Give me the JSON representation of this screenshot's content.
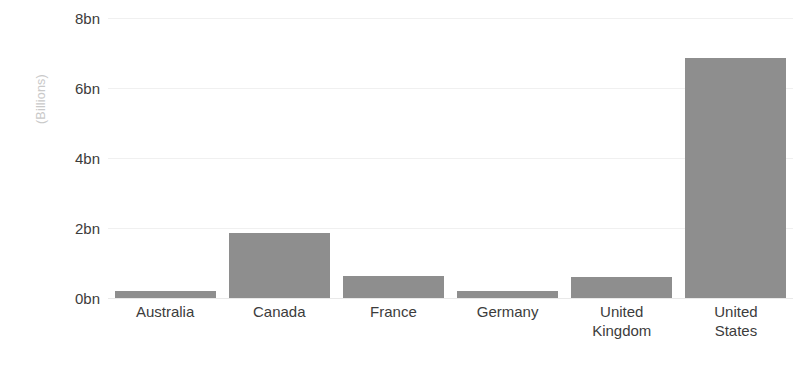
{
  "chart_data": {
    "type": "bar",
    "title": "",
    "subtitle": "",
    "xlabel": "",
    "ylabel": "(Billions)",
    "categories": [
      "Australia",
      "Canada",
      "France",
      "Germany",
      "United\nKingdom",
      "United\nStates"
    ],
    "values": [
      0.2,
      1.85,
      0.63,
      0.2,
      0.6,
      6.85
    ],
    "ylim": [
      0,
      8
    ],
    "y_ticks": [
      0,
      2,
      4,
      6,
      8
    ],
    "y_tick_labels": [
      "0bn",
      "2bn",
      "4bn",
      "6bn",
      "8bn"
    ],
    "grid": true,
    "legend": false,
    "legend_position": "none",
    "bar_color": "#8e8e8e",
    "gridline_color": "#f0f0f0",
    "tick_label_color": "#3c3c3c",
    "axis_title_color": "#c9c9c9",
    "background_color": "#ffffff"
  }
}
